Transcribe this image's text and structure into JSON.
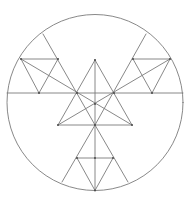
{
  "diagram": {
    "width": 189,
    "height": 197,
    "background": "#ffffff",
    "stroke_color": "#7a7a7a",
    "point_color": "#444444",
    "circle": {
      "cx": 95,
      "cy": 102.5,
      "r": 88
    },
    "segments": [
      {
        "name": "horizontal-diameter",
        "x1": 7,
        "y1": 93,
        "x2": 183,
        "y2": 93
      },
      {
        "name": "vertical-axis",
        "x1": 95,
        "y1": 60,
        "x2": 95,
        "y2": 190.5
      },
      {
        "name": "center-triangle-left",
        "x1": 95,
        "y1": 60,
        "x2": 58,
        "y2": 125
      },
      {
        "name": "center-triangle-right",
        "x1": 95,
        "y1": 60,
        "x2": 132,
        "y2": 125
      },
      {
        "name": "center-triangle-base",
        "x1": 58,
        "y1": 125,
        "x2": 132,
        "y2": 125
      },
      {
        "name": "left-chord-outer",
        "x1": 43,
        "y1": 34,
        "x2": 95,
        "y2": 125
      },
      {
        "name": "right-chord-outer",
        "x1": 146,
        "y1": 34,
        "x2": 95,
        "y2": 125
      },
      {
        "name": "left-long-diagonal",
        "x1": 21,
        "y1": 59,
        "x2": 132,
        "y2": 125
      },
      {
        "name": "right-long-diagonal",
        "x1": 170,
        "y1": 59,
        "x2": 58,
        "y2": 125
      },
      {
        "name": "ul-small-top",
        "x1": 21,
        "y1": 59,
        "x2": 58,
        "y2": 59
      },
      {
        "name": "ul-small-left",
        "x1": 21,
        "y1": 59,
        "x2": 39,
        "y2": 93
      },
      {
        "name": "ul-small-right",
        "x1": 58,
        "y1": 59,
        "x2": 39,
        "y2": 93
      },
      {
        "name": "ur-small-top",
        "x1": 133,
        "y1": 59,
        "x2": 170,
        "y2": 59
      },
      {
        "name": "ur-small-left",
        "x1": 133,
        "y1": 59,
        "x2": 152,
        "y2": 93
      },
      {
        "name": "ur-small-right",
        "x1": 170,
        "y1": 59,
        "x2": 152,
        "y2": 93
      },
      {
        "name": "bottom-chord-left",
        "x1": 95,
        "y1": 125,
        "x2": 62,
        "y2": 182
      },
      {
        "name": "bottom-chord-right",
        "x1": 95,
        "y1": 125,
        "x2": 128,
        "y2": 182
      },
      {
        "name": "bottom-small-top",
        "x1": 77,
        "y1": 158,
        "x2": 113,
        "y2": 158
      },
      {
        "name": "bottom-small-left",
        "x1": 77,
        "y1": 158,
        "x2": 95,
        "y2": 190.5
      },
      {
        "name": "bottom-small-right",
        "x1": 113,
        "y1": 158,
        "x2": 95,
        "y2": 190.5
      }
    ],
    "points": [
      {
        "name": "center-apex",
        "x": 95,
        "y": 60
      },
      {
        "name": "left-crossing",
        "x": 77,
        "y": 93
      },
      {
        "name": "right-crossing",
        "x": 114,
        "y": 93
      },
      {
        "name": "center-crossing",
        "x": 95,
        "y": 104
      },
      {
        "name": "base-left",
        "x": 58,
        "y": 125
      },
      {
        "name": "base-right",
        "x": 132,
        "y": 125
      },
      {
        "name": "base-middle",
        "x": 95,
        "y": 125
      },
      {
        "name": "ul-vertex-a",
        "x": 21,
        "y": 59
      },
      {
        "name": "ul-vertex-b",
        "x": 58,
        "y": 59
      },
      {
        "name": "ul-vertex-c",
        "x": 39,
        "y": 93
      },
      {
        "name": "ur-vertex-a",
        "x": 133,
        "y": 59
      },
      {
        "name": "ur-vertex-b",
        "x": 170,
        "y": 59
      },
      {
        "name": "ur-vertex-c",
        "x": 152,
        "y": 93
      },
      {
        "name": "bottom-vertex-left",
        "x": 77,
        "y": 158
      },
      {
        "name": "bottom-vertex-right",
        "x": 113,
        "y": 158
      },
      {
        "name": "bottom-vertex-mid",
        "x": 95,
        "y": 158
      },
      {
        "name": "bottom-vertex-tip",
        "x": 95,
        "y": 190.5
      }
    ]
  }
}
